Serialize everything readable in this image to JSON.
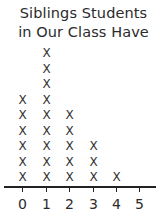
{
  "chart_data": {
    "type": "dot_plot",
    "title": "Siblings Students in Our Class Have",
    "title_lines": [
      "Siblings Students",
      "in Our Class Have"
    ],
    "categories": [
      "0",
      "1",
      "2",
      "3",
      "4",
      "5"
    ],
    "values": [
      6,
      9,
      5,
      3,
      1,
      0
    ],
    "marker": "X",
    "xlabel": "",
    "ylabel": "",
    "grid": false,
    "legend": null
  }
}
